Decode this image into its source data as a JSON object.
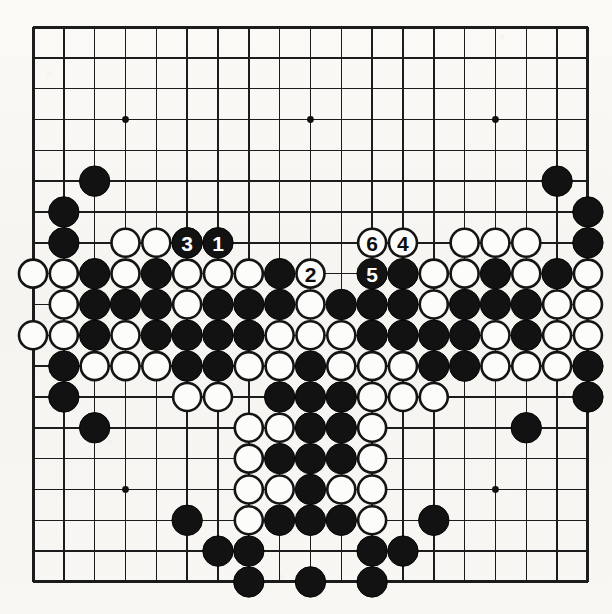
{
  "figure": {
    "type": "go-board-diagram",
    "board_size": 19,
    "title": "",
    "caption": "",
    "background_color": "#f7f6f2",
    "line_color": "#1c1c1c",
    "black_stone_color": "#121212",
    "white_stone_color": "#fcfcfa"
  },
  "geometry": {
    "origin_x": 33,
    "origin_y": 27,
    "spacing": 30.83,
    "stone_radius": 15.2,
    "line_width": 1.5,
    "edge_line_width": 3,
    "hoshi_radius": 3.4
  },
  "star_points": [
    {
      "col": 3,
      "row": 3
    },
    {
      "col": 9,
      "row": 3
    },
    {
      "col": 15,
      "row": 3
    },
    {
      "col": 3,
      "row": 9
    },
    {
      "col": 9,
      "row": 9
    },
    {
      "col": 15,
      "row": 9
    },
    {
      "col": 3,
      "row": 15
    },
    {
      "col": 9,
      "row": 15
    },
    {
      "col": 15,
      "row": 15
    }
  ],
  "stones": {
    "black": [
      {
        "col": 2,
        "row": 5
      },
      {
        "col": 1,
        "row": 6
      },
      {
        "col": 17,
        "row": 5
      },
      {
        "col": 18,
        "row": 6
      },
      {
        "col": 1,
        "row": 7
      },
      {
        "col": 18,
        "row": 7
      },
      {
        "col": 2,
        "row": 8
      },
      {
        "col": 4,
        "row": 8
      },
      {
        "col": 8,
        "row": 8
      },
      {
        "col": 12,
        "row": 8
      },
      {
        "col": 15,
        "row": 8
      },
      {
        "col": 17,
        "row": 8
      },
      {
        "col": 2,
        "row": 9
      },
      {
        "col": 3,
        "row": 9
      },
      {
        "col": 4,
        "row": 9
      },
      {
        "col": 6,
        "row": 9
      },
      {
        "col": 7,
        "row": 9
      },
      {
        "col": 8,
        "row": 9
      },
      {
        "col": 10,
        "row": 9
      },
      {
        "col": 11,
        "row": 9
      },
      {
        "col": 12,
        "row": 9
      },
      {
        "col": 14,
        "row": 9
      },
      {
        "col": 15,
        "row": 9
      },
      {
        "col": 16,
        "row": 9
      },
      {
        "col": 2,
        "row": 10
      },
      {
        "col": 4,
        "row": 10
      },
      {
        "col": 5,
        "row": 10
      },
      {
        "col": 6,
        "row": 10
      },
      {
        "col": 7,
        "row": 10
      },
      {
        "col": 11,
        "row": 10
      },
      {
        "col": 12,
        "row": 10
      },
      {
        "col": 13,
        "row": 10
      },
      {
        "col": 14,
        "row": 10
      },
      {
        "col": 16,
        "row": 10
      },
      {
        "col": 1,
        "row": 11
      },
      {
        "col": 5,
        "row": 11
      },
      {
        "col": 6,
        "row": 11
      },
      {
        "col": 9,
        "row": 11
      },
      {
        "col": 13,
        "row": 11
      },
      {
        "col": 14,
        "row": 11
      },
      {
        "col": 18,
        "row": 11
      },
      {
        "col": 1,
        "row": 12
      },
      {
        "col": 8,
        "row": 12
      },
      {
        "col": 9,
        "row": 12
      },
      {
        "col": 10,
        "row": 12
      },
      {
        "col": 18,
        "row": 12
      },
      {
        "col": 2,
        "row": 13
      },
      {
        "col": 9,
        "row": 13
      },
      {
        "col": 10,
        "row": 13
      },
      {
        "col": 16,
        "row": 13
      },
      {
        "col": 8,
        "row": 14
      },
      {
        "col": 9,
        "row": 14
      },
      {
        "col": 10,
        "row": 14
      },
      {
        "col": 9,
        "row": 15
      },
      {
        "col": 5,
        "row": 16
      },
      {
        "col": 8,
        "row": 16
      },
      {
        "col": 9,
        "row": 16
      },
      {
        "col": 10,
        "row": 16
      },
      {
        "col": 13,
        "row": 16
      },
      {
        "col": 6,
        "row": 17
      },
      {
        "col": 7,
        "row": 17
      },
      {
        "col": 11,
        "row": 17
      },
      {
        "col": 12,
        "row": 17
      },
      {
        "col": 7,
        "row": 18
      },
      {
        "col": 9,
        "row": 18
      },
      {
        "col": 11,
        "row": 18
      }
    ],
    "white": [
      {
        "col": 3,
        "row": 7
      },
      {
        "col": 4,
        "row": 7
      },
      {
        "col": 5,
        "row": 7
      },
      {
        "col": 14,
        "row": 7
      },
      {
        "col": 15,
        "row": 7
      },
      {
        "col": 16,
        "row": 7
      },
      {
        "col": 0,
        "row": 8
      },
      {
        "col": 1,
        "row": 8
      },
      {
        "col": 3,
        "row": 8
      },
      {
        "col": 5,
        "row": 8
      },
      {
        "col": 6,
        "row": 8
      },
      {
        "col": 7,
        "row": 8
      },
      {
        "col": 13,
        "row": 8
      },
      {
        "col": 14,
        "row": 8
      },
      {
        "col": 16,
        "row": 8
      },
      {
        "col": 18,
        "row": 8
      },
      {
        "col": 1,
        "row": 9
      },
      {
        "col": 5,
        "row": 9
      },
      {
        "col": 9,
        "row": 9
      },
      {
        "col": 13,
        "row": 9
      },
      {
        "col": 17,
        "row": 9
      },
      {
        "col": 18,
        "row": 9
      },
      {
        "col": 0,
        "row": 10
      },
      {
        "col": 1,
        "row": 10
      },
      {
        "col": 3,
        "row": 10
      },
      {
        "col": 8,
        "row": 10
      },
      {
        "col": 9,
        "row": 10
      },
      {
        "col": 10,
        "row": 10
      },
      {
        "col": 15,
        "row": 10
      },
      {
        "col": 17,
        "row": 10
      },
      {
        "col": 18,
        "row": 10
      },
      {
        "col": 2,
        "row": 11
      },
      {
        "col": 3,
        "row": 11
      },
      {
        "col": 4,
        "row": 11
      },
      {
        "col": 7,
        "row": 11
      },
      {
        "col": 8,
        "row": 11
      },
      {
        "col": 10,
        "row": 11
      },
      {
        "col": 11,
        "row": 11
      },
      {
        "col": 12,
        "row": 11
      },
      {
        "col": 15,
        "row": 11
      },
      {
        "col": 16,
        "row": 11
      },
      {
        "col": 17,
        "row": 11
      },
      {
        "col": 5,
        "row": 12
      },
      {
        "col": 6,
        "row": 12
      },
      {
        "col": 11,
        "row": 12
      },
      {
        "col": 12,
        "row": 12
      },
      {
        "col": 13,
        "row": 12
      },
      {
        "col": 7,
        "row": 13
      },
      {
        "col": 8,
        "row": 13
      },
      {
        "col": 11,
        "row": 13
      },
      {
        "col": 7,
        "row": 14
      },
      {
        "col": 11,
        "row": 14
      },
      {
        "col": 7,
        "row": 15
      },
      {
        "col": 8,
        "row": 15
      },
      {
        "col": 10,
        "row": 15
      },
      {
        "col": 11,
        "row": 15
      },
      {
        "col": 7,
        "row": 16
      },
      {
        "col": 11,
        "row": 16
      }
    ]
  },
  "moves": [
    {
      "number": "1",
      "col": 6,
      "row": 7,
      "color": "black"
    },
    {
      "number": "2",
      "col": 9,
      "row": 8,
      "color": "white"
    },
    {
      "number": "3",
      "col": 5,
      "row": 7,
      "color": "black"
    },
    {
      "number": "4",
      "col": 12,
      "row": 7,
      "color": "white"
    },
    {
      "number": "5",
      "col": 11,
      "row": 8,
      "color": "black"
    },
    {
      "number": "6",
      "col": 11,
      "row": 7,
      "color": "white"
    }
  ]
}
